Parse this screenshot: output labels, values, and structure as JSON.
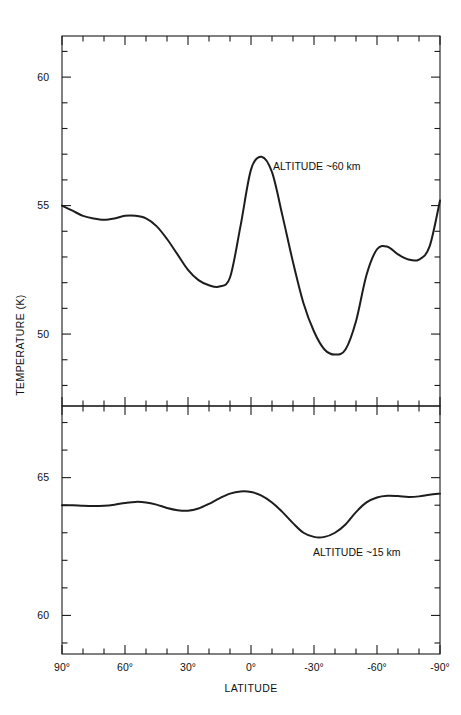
{
  "figure": {
    "background_color": "#ffffff",
    "line_color": "#1d1d1d",
    "axis_color": "#1a1a1a"
  },
  "axes": {
    "xlabel": "LATITUDE",
    "ylabel": "TEMPERATURE (K)",
    "x_tick_labels": [
      "90°",
      "60°",
      "30°",
      "0°",
      "-30°",
      "-60°",
      "-90°"
    ],
    "x_tick_values": [
      90,
      60,
      30,
      0,
      -30,
      -60,
      -90
    ],
    "x_minor_interval": 10,
    "top_y_tick_labels": [
      "60",
      "55",
      "50"
    ],
    "top_y_tick_values": [
      60,
      55,
      50
    ],
    "bottom_y_tick_labels": [
      "65",
      "60"
    ],
    "bottom_y_tick_values": [
      65,
      60
    ],
    "y_minor_interval": 1
  },
  "annotations": {
    "top_panel": "ALTITUDE ~60 km",
    "bottom_panel": "ALTITUDE ~15 km"
  },
  "chart_data": {
    "type": "line",
    "title": "",
    "xlabel": "LATITUDE",
    "ylabel": "TEMPERATURE (K)",
    "xlim": [
      90,
      -90
    ],
    "grid": false,
    "legend": "none",
    "panels": [
      {
        "name": "top-panel",
        "annotation": "ALTITUDE ~60 km",
        "ylim": [
          47.2,
          61.6
        ],
        "ylabel": "TEMPERATURE (K)",
        "y_ticks_major": [
          60,
          55,
          50
        ],
        "series": [
          {
            "name": "ALTITUDE ~60 km",
            "x": [
              90,
              85,
              80,
              75,
              70,
              65,
              60,
              55,
              50,
              45,
              40,
              35,
              30,
              25,
              20,
              15,
              10,
              5,
              0,
              -5,
              -10,
              -15,
              -20,
              -25,
              -30,
              -35,
              -40,
              -45,
              -50,
              -55,
              -60,
              -65,
              -70,
              -75,
              -80,
              -85,
              -90
            ],
            "y": [
              55.0,
              54.8,
              54.6,
              54.5,
              54.45,
              54.5,
              54.6,
              54.6,
              54.5,
              54.2,
              53.7,
              53.1,
              52.5,
              52.1,
              51.9,
              51.85,
              52.2,
              54.2,
              56.4,
              56.9,
              56.3,
              54.6,
              52.8,
              51.2,
              50.1,
              49.4,
              49.2,
              49.4,
              50.5,
              52.3,
              53.3,
              53.4,
              53.1,
              52.9,
              52.9,
              53.4,
              55.2
            ]
          }
        ]
      },
      {
        "name": "bottom-panel",
        "annotation": "ALTITUDE ~15 km",
        "ylim": [
          58.6,
          67.6
        ],
        "ylabel": "TEMPERATURE (K)",
        "y_ticks_major": [
          65,
          60
        ],
        "series": [
          {
            "name": "ALTITUDE ~15 km",
            "x": [
              90,
              85,
              80,
              75,
              70,
              65,
              60,
              55,
              50,
              45,
              40,
              35,
              30,
              25,
              20,
              15,
              10,
              5,
              0,
              -5,
              -10,
              -15,
              -20,
              -25,
              -30,
              -35,
              -40,
              -45,
              -50,
              -55,
              -60,
              -65,
              -70,
              -75,
              -80,
              -85,
              -90
            ],
            "y": [
              64.0,
              64.0,
              63.98,
              63.97,
              63.98,
              64.02,
              64.08,
              64.12,
              64.1,
              64.02,
              63.9,
              63.82,
              63.8,
              63.88,
              64.05,
              64.25,
              64.42,
              64.5,
              64.48,
              64.35,
              64.1,
              63.75,
              63.35,
              63.0,
              62.85,
              62.85,
              63.0,
              63.3,
              63.75,
              64.1,
              64.28,
              64.34,
              64.33,
              64.3,
              64.32,
              64.38,
              64.42
            ]
          }
        ]
      }
    ]
  }
}
